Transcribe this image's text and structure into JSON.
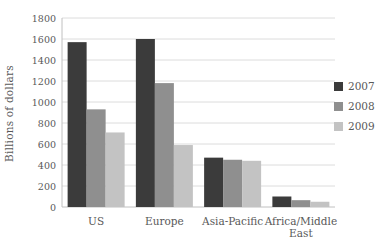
{
  "chart_data": {
    "type": "bar",
    "title": "",
    "xlabel": "",
    "ylabel": "Billions of dollars",
    "categories": [
      "US",
      "Europe",
      "Asia-Pacific",
      "Africa/Middle East"
    ],
    "series": [
      {
        "name": "2007",
        "color": "#3b3b3b",
        "values": [
          1570,
          1600,
          470,
          100
        ]
      },
      {
        "name": "2008",
        "color": "#8f8f8f",
        "values": [
          930,
          1180,
          450,
          65
        ]
      },
      {
        "name": "2009",
        "color": "#c3c3c3",
        "values": [
          710,
          590,
          440,
          50
        ]
      }
    ],
    "ylim": [
      0,
      1800
    ],
    "ytick_step": 200,
    "grid": true,
    "legend_position": "right"
  },
  "colors": {
    "gridline": "#dcdcdc",
    "axis_line": "#c0c0c0",
    "text": "#595959",
    "background": "#ffffff"
  }
}
